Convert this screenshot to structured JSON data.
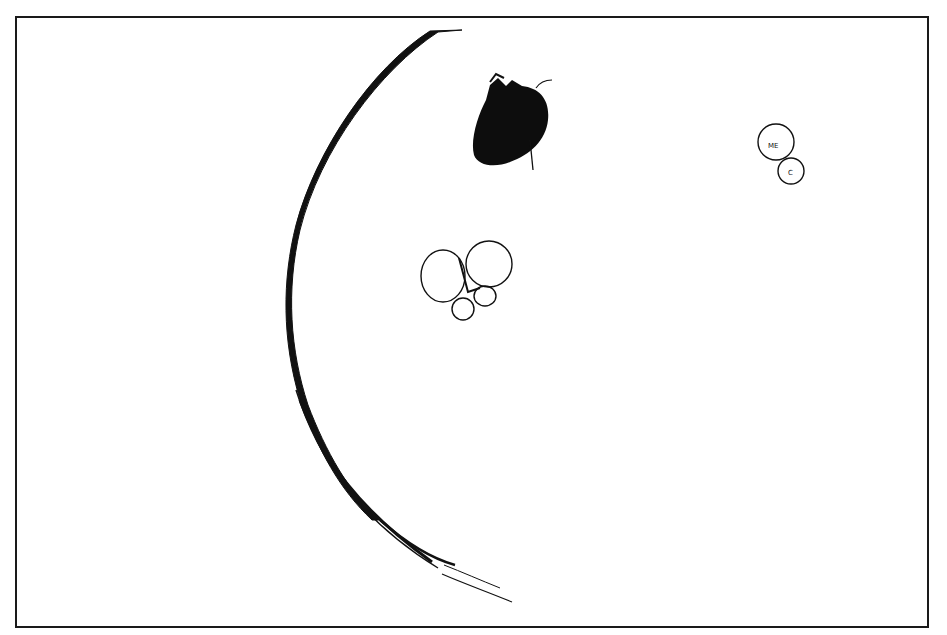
{
  "figure": {
    "frame": {
      "border_color": "#1a1a1a",
      "background": "#ffffff"
    },
    "elements": {
      "large_arc": {
        "description": "large curved black arc sweeping from top to bottom-right",
        "color": "#111111"
      },
      "filled_blob": {
        "description": "solid black scribbled oval shape with a short stem",
        "color": "#0d0d0d"
      },
      "cluster_cells": {
        "description": "cluster of four outlined circles (two large, two small)",
        "count": 4
      },
      "labeled_cells": {
        "large_label": "ME",
        "small_label": "C"
      }
    }
  }
}
